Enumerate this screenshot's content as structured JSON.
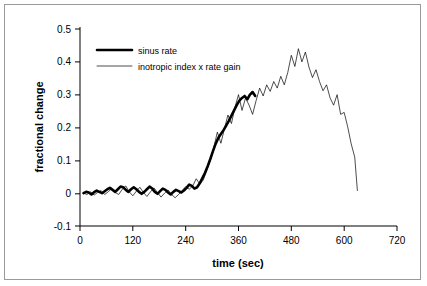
{
  "chart_data": {
    "type": "line",
    "title": "",
    "xlabel": "time (sec)",
    "ylabel": "fractional change",
    "xlim": [
      0,
      720
    ],
    "ylim": [
      -0.1,
      0.5
    ],
    "xticks": [
      "0",
      "120",
      "240",
      "360",
      "480",
      "600",
      "720"
    ],
    "yticks": [
      "-0.1",
      "0",
      "0.1",
      "0.2",
      "0.3",
      "0.4",
      "0.5"
    ],
    "grid": false,
    "legend_position": "top-left-inside",
    "series": [
      {
        "name": "sinus rate",
        "style": "thick-black-line",
        "x": [
          8,
          14,
          20,
          26,
          32,
          38,
          44,
          50,
          56,
          62,
          68,
          74,
          80,
          86,
          92,
          98,
          104,
          110,
          116,
          122,
          128,
          134,
          140,
          146,
          152,
          158,
          164,
          170,
          176,
          182,
          188,
          194,
          200,
          206,
          212,
          218,
          224,
          230,
          236,
          242,
          248,
          254,
          260,
          266,
          272,
          278,
          284,
          290,
          296,
          302,
          308,
          314,
          320,
          326,
          332,
          338,
          344,
          350,
          356,
          362,
          368,
          374,
          380,
          386,
          392,
          398
        ],
        "y": [
          0.0,
          0.004,
          0.002,
          -0.004,
          0.003,
          0.008,
          0.004,
          0.0,
          0.006,
          0.012,
          0.016,
          0.01,
          0.004,
          0.012,
          0.02,
          0.018,
          0.01,
          0.004,
          0.012,
          0.018,
          0.012,
          0.004,
          -0.002,
          0.004,
          0.012,
          0.02,
          0.014,
          0.004,
          -0.002,
          0.006,
          0.014,
          0.01,
          0.002,
          -0.004,
          0.004,
          0.01,
          0.006,
          0.002,
          0.008,
          0.016,
          0.026,
          0.022,
          0.014,
          0.018,
          0.03,
          0.046,
          0.062,
          0.082,
          0.104,
          0.128,
          0.15,
          0.168,
          0.18,
          0.192,
          0.206,
          0.22,
          0.236,
          0.252,
          0.268,
          0.282,
          0.29,
          0.296,
          0.286,
          0.3,
          0.308,
          0.296
        ]
      },
      {
        "name": "inotropic index x rate gain",
        "style": "thin-black-line",
        "x": [
          8,
          16,
          24,
          32,
          40,
          48,
          56,
          64,
          72,
          80,
          88,
          96,
          104,
          112,
          120,
          128,
          136,
          144,
          152,
          160,
          168,
          176,
          184,
          192,
          200,
          208,
          216,
          224,
          232,
          240,
          248,
          256,
          264,
          272,
          280,
          288,
          296,
          304,
          312,
          320,
          328,
          336,
          344,
          352,
          360,
          368,
          376,
          384,
          392,
          400,
          408,
          416,
          424,
          432,
          440,
          448,
          456,
          464,
          472,
          480,
          488,
          496,
          504,
          512,
          520,
          528,
          536,
          544,
          552,
          560,
          568,
          576,
          584,
          592,
          600,
          608,
          616,
          624,
          630
        ],
        "y": [
          0.0,
          -0.004,
          0.004,
          -0.006,
          0.002,
          0.008,
          -0.004,
          0.004,
          0.014,
          0.002,
          -0.004,
          0.012,
          0.022,
          0.004,
          -0.008,
          0.006,
          0.018,
          0.002,
          -0.01,
          0.004,
          0.016,
          0.002,
          -0.012,
          0.0,
          0.01,
          -0.004,
          -0.014,
          -0.004,
          0.008,
          0.02,
          0.012,
          0.022,
          0.044,
          0.028,
          0.04,
          0.07,
          0.1,
          0.14,
          0.186,
          0.152,
          0.196,
          0.238,
          0.212,
          0.262,
          0.3,
          0.252,
          0.29,
          0.268,
          0.24,
          0.282,
          0.32,
          0.296,
          0.33,
          0.31,
          0.34,
          0.32,
          0.356,
          0.33,
          0.368,
          0.42,
          0.386,
          0.44,
          0.4,
          0.43,
          0.384,
          0.352,
          0.376,
          0.34,
          0.312,
          0.33,
          0.29,
          0.268,
          0.3,
          0.24,
          0.246,
          0.202,
          0.15,
          0.11,
          0.008
        ]
      }
    ],
    "legend": [
      {
        "label": "sinus rate",
        "style": "thick-black-line"
      },
      {
        "label": "inotropic index x rate gain",
        "style": "thin-black-line"
      }
    ]
  }
}
